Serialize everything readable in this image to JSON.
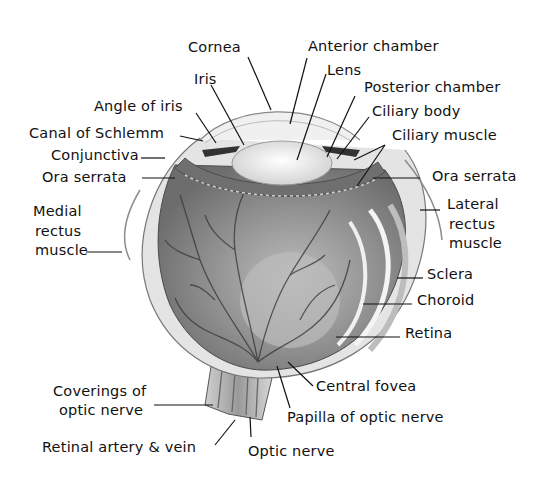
{
  "diagram": {
    "colors": {
      "tissue": "#8a8a8a",
      "lens": "#f2f2f2",
      "sclera": "#d8d8d8",
      "vessel": "#3a3a3a",
      "text": "#111111"
    },
    "labels": {
      "cornea": "Cornea",
      "anterior_chamber": "Anterior chamber",
      "iris": "Iris",
      "lens": "Lens",
      "posterior_chamber": "Posterior chamber",
      "angle_of_iris": "Angle of iris",
      "ciliary_body": "Ciliary body",
      "canal_of_schlemm": "Canal of Schlemm",
      "ciliary_muscle": "Ciliary muscle",
      "conjunctiva": "Conjunctiva",
      "ora_serrata_left": "Ora serrata",
      "ora_serrata_right": "Ora serrata",
      "medial_rectus_1": "Medial",
      "medial_rectus_2": "rectus",
      "medial_rectus_3": "muscle",
      "lateral_rectus_1": "Lateral",
      "lateral_rectus_2": "rectus",
      "lateral_rectus_3": "muscle",
      "sclera": "Sclera",
      "choroid": "Choroid",
      "retina": "Retina",
      "central_fovea": "Central fovea",
      "coverings_1": "Coverings of",
      "coverings_2": "optic nerve",
      "papilla": "Papilla of optic nerve",
      "retinal_artery_vein": "Retinal artery & vein",
      "optic_nerve": "Optic nerve"
    }
  }
}
